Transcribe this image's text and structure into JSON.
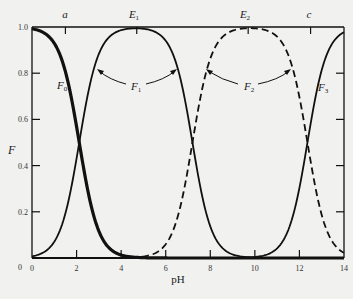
{
  "chart_data": {
    "type": "line",
    "title": "",
    "xlabel": "pH",
    "ylabel": "F",
    "xlim": [
      0,
      14
    ],
    "ylim": [
      0,
      1.0
    ],
    "grid": false,
    "x_ticks": [
      "0",
      "2",
      "4",
      "6",
      "8",
      "10",
      "12",
      "14"
    ],
    "y_ticks": [
      "0",
      "0.2",
      "0.4",
      "0.6",
      "0.8",
      "1.0"
    ],
    "pKa": [
      2.12,
      7.2,
      12.36
    ],
    "x": [
      0,
      1,
      2,
      3,
      4,
      5,
      6,
      7,
      8,
      9,
      10,
      11,
      12,
      13,
      14
    ],
    "series": [
      {
        "name": "F0",
        "style": "solid-thick",
        "values": [
          0.993,
          0.93,
          0.57,
          0.116,
          0.013,
          0.001,
          0,
          0,
          0,
          0,
          0,
          0,
          0,
          0,
          0
        ]
      },
      {
        "name": "F1",
        "style": "solid",
        "values": [
          0.0075,
          0.07,
          0.43,
          0.884,
          0.985,
          0.993,
          0.94,
          0.61,
          0.137,
          0.016,
          0.0016,
          0,
          0,
          0,
          0
        ]
      },
      {
        "name": "F2",
        "style": "dashed",
        "values": [
          0,
          0,
          0,
          0,
          0.001,
          0.006,
          0.059,
          0.39,
          0.863,
          0.984,
          0.996,
          0.958,
          0.696,
          0.186,
          0.022
        ]
      },
      {
        "name": "F3",
        "style": "solid",
        "values": [
          0,
          0,
          0,
          0,
          0,
          0,
          0,
          0,
          0,
          0,
          0.004,
          0.042,
          0.304,
          0.814,
          0.978
        ]
      }
    ],
    "annotations": [
      {
        "text": "a",
        "x": 1.5,
        "position": "top"
      },
      {
        "text": "E1",
        "x": 4.7,
        "position": "top"
      },
      {
        "text": "E2",
        "x": 9.7,
        "position": "top"
      },
      {
        "text": "c",
        "x": 12.5,
        "position": "top"
      },
      {
        "text": "F0",
        "near_x": 1.3,
        "near_y": 0.72
      },
      {
        "text": "F1",
        "arrows_to": [
          [
            3.0,
            0.8
          ],
          [
            6.6,
            0.8
          ]
        ]
      },
      {
        "text": "F2",
        "arrows_to": [
          [
            7.6,
            0.8
          ],
          [
            11.9,
            0.8
          ]
        ]
      },
      {
        "text": "F3",
        "near_x": 13.2,
        "near_y": 0.72
      }
    ]
  },
  "labels": {
    "y_axis": "F",
    "x_axis": "pH",
    "top_a": "a",
    "top_E": "E",
    "top_E1_sub": "1",
    "top_E2_sub": "2",
    "top_c": "c",
    "F": "F",
    "sub0": "0",
    "sub1": "1",
    "sub2": "2",
    "sub3": "3"
  }
}
